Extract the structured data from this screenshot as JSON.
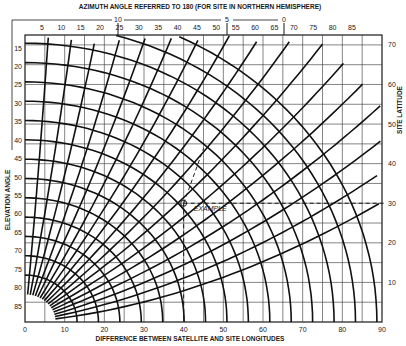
{
  "chart_data": {
    "type": "line",
    "title": "AZIMUTH ANGLE REFERRED TO 180 (FOR SITE IN NORTHERN HEMISPHERE)",
    "xlabel": "DIFFERENCE BETWEEN SATELLITE AND SITE LONGITUDES",
    "ylabel_left": "ELEVATION ANGLE",
    "ylabel_right": "SITE LATITUDE",
    "x_ticks": [
      "0",
      "10",
      "20",
      "30",
      "40",
      "50",
      "60",
      "70",
      "80",
      "90"
    ],
    "xlim": [
      0,
      90
    ],
    "left_ticks": [
      "15",
      "20",
      "25",
      "30",
      "35",
      "40",
      "45",
      "50",
      "55",
      "60",
      "65",
      "70",
      "75",
      "80",
      "85"
    ],
    "right_ticks": [
      "70",
      "60",
      "50",
      "40",
      "30",
      "20",
      "10"
    ],
    "right_lim": [
      0,
      70
    ],
    "top_azimuth_ticks": [
      "5",
      "10",
      "15",
      "20",
      "25",
      "30",
      "35",
      "40",
      "45",
      "50",
      "55",
      "60",
      "65",
      "70",
      "75",
      "80",
      "85"
    ],
    "top_bracket_ticks": [
      "10",
      "5",
      "0"
    ],
    "grid": true,
    "annotations": [
      {
        "text": "EXAMPLE",
        "x": 40,
        "latitude": 30
      }
    ],
    "series": [
      {
        "name": "elevation contours",
        "values": [
          15,
          20,
          25,
          30,
          35,
          40,
          45,
          50,
          55,
          60,
          65,
          70,
          75,
          80,
          85
        ]
      },
      {
        "name": "azimuth contours",
        "values": [
          5,
          10,
          15,
          20,
          25,
          30,
          35,
          40,
          45,
          50,
          55,
          60,
          65,
          70,
          75,
          80,
          85
        ]
      }
    ]
  }
}
